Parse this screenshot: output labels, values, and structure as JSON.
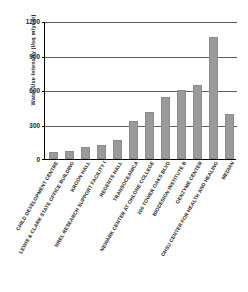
{
  "chart_data": {
    "type": "bar",
    "title": "",
    "xlabel": "",
    "ylabel": "Water Use Intensity (l/sq m/year)",
    "ylim": [
      0,
      1200
    ],
    "yticks": [
      0,
      300,
      600,
      900,
      1200
    ],
    "grid": true,
    "legend": "none",
    "bar_color": "#9a9a9a",
    "categories": [
      "CHILD DEVELOPMENT CENTRE",
      "LEWIS & CLARK STATE OFFICE BUILDING",
      "KROON HALL",
      "NREL RESEARCH SUPPORT FACILITY I",
      "REGENTS HALL",
      "TRANSOCEANICA",
      "NEWARK CENTER AT OHLONE COLLEGE",
      "200 TOWER OAKS BLVD",
      "BIODESIGN INSTITUTE B",
      "GENZYME CENTER",
      "OHSU CENTER FOR HEALTH AND HEALING",
      "MEDIAN"
    ],
    "values": [
      65,
      70,
      105,
      125,
      165,
      330,
      405,
      540,
      600,
      640,
      1060,
      390
    ]
  },
  "axis": {
    "y_tick_labels": [
      "1200",
      "900",
      "600",
      "300",
      "0"
    ]
  }
}
